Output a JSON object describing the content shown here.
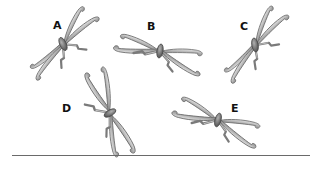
{
  "figure": {
    "items": [
      {
        "id": "A",
        "label": "A"
      },
      {
        "id": "B",
        "label": "B"
      },
      {
        "id": "C",
        "label": "C"
      },
      {
        "id": "D",
        "label": "D"
      },
      {
        "id": "E",
        "label": "E"
      }
    ],
    "colors": {
      "wing_light": "#d9d9d9",
      "wing_dark": "#8a8a8a",
      "body": "#5a5a5a",
      "label": "#111111",
      "baseline": "#6a6a6a"
    }
  }
}
